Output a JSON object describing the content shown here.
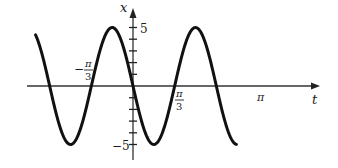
{
  "chart_data": {
    "type": "line",
    "title": "",
    "xlabel": "t",
    "ylabel": "x",
    "function": "x = -5 sin(3t)",
    "amplitude": 5,
    "period": "2π/3",
    "x_range": [
      -2.45,
      2.6
    ],
    "ylim": [
      -5,
      5
    ],
    "grid": false,
    "legend": null,
    "x_tick_labels": [
      "-π/3",
      "π/3",
      "π"
    ],
    "y_tick_labels": [
      "5",
      "-5"
    ],
    "y_minor_ticks": [
      1,
      2,
      3,
      4,
      -1,
      -2,
      -3,
      -4
    ],
    "series": [
      {
        "name": "x(t)",
        "x": [
          -2.45,
          -2.094,
          -1.571,
          -1.047,
          -0.524,
          0,
          0.524,
          1.047,
          1.571,
          2.094,
          2.618
        ],
        "values": [
          4.4,
          0,
          -5,
          0,
          5,
          0,
          -5,
          0,
          5,
          0,
          -5
        ]
      }
    ],
    "color": "#1a1a1a"
  },
  "labels": {
    "x_axis": "t",
    "y_axis": "x",
    "y_top": "5",
    "y_bottom": "−5",
    "neg_pi_3_num": "π",
    "neg_pi_3_sign": "−",
    "neg_pi_3_den": "3",
    "pi_3_num": "π",
    "pi_3_den": "3",
    "pi": "π"
  }
}
